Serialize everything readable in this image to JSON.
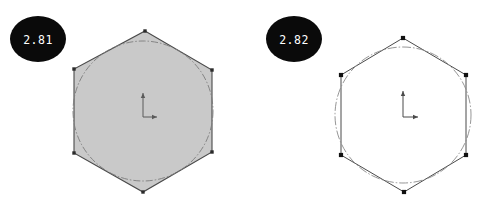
{
  "figure": {
    "background_color": "#ffffff",
    "width": 482,
    "height": 208,
    "panel_count": 2
  },
  "panels": [
    {
      "id": "panel-left",
      "badge": {
        "label": "2.81",
        "shape": "ellipse",
        "fill_color": "#0a0a0a",
        "text_color": "#ffffff",
        "cx": 38,
        "cy": 39,
        "rx": 28,
        "ry": 23
      },
      "polygon": {
        "name": "hexagon",
        "sides": 6,
        "filled": true,
        "fill_color": "#c9c9c9",
        "stroke_color": "#4a4a4a",
        "stroke_width": 1.1,
        "vertices": [
          [
            145,
            31
          ],
          [
            212,
            70
          ],
          [
            212,
            152
          ],
          [
            143,
            192
          ],
          [
            74,
            153
          ],
          [
            74,
            69
          ]
        ],
        "vertex_marker": {
          "shape": "square",
          "color": "#2b2b2b",
          "size": 3.4,
          "visible": true
        }
      },
      "inscribed_circle": {
        "cx": 143,
        "cy": 111,
        "r": 70,
        "stroke_color": "#7d7d7d",
        "stroke_width": 0.9,
        "dash_pattern": "7,2,1.5,2",
        "filled": false
      },
      "axis_marker": {
        "name": "orientation-axes",
        "origin": [
          143,
          117
        ],
        "vertical_arrow_length": 24,
        "horizontal_arrow_length": 14,
        "color": "#5a5a5a",
        "stroke_width": 1.0
      }
    },
    {
      "id": "panel-right",
      "badge": {
        "label": "2.82",
        "shape": "ellipse",
        "fill_color": "#0a0a0a",
        "text_color": "#ffffff",
        "cx": 294,
        "cy": 39,
        "rx": 28,
        "ry": 23
      },
      "polygon": {
        "name": "hexagon",
        "sides": 6,
        "filled": false,
        "fill_color": "none",
        "stroke_color": "#4a4a4a",
        "stroke_width": 1.0,
        "vertices": [
          [
            403,
            38
          ],
          [
            466,
            75
          ],
          [
            466,
            155
          ],
          [
            404,
            192
          ],
          [
            341,
            155
          ],
          [
            341,
            75
          ]
        ],
        "vertex_marker": {
          "shape": "square",
          "color": "#111111",
          "size": 4.2,
          "visible": true
        }
      },
      "inscribed_circle": {
        "cx": 403,
        "cy": 115,
        "r": 68,
        "stroke_color": "#8a8a8a",
        "stroke_width": 0.9,
        "dash_pattern": "9,2,1.5,2",
        "filled": false
      },
      "axis_marker": {
        "name": "orientation-axes",
        "origin": [
          403,
          117
        ],
        "vertical_arrow_length": 26,
        "horizontal_arrow_length": 15,
        "color": "#4a4a4a",
        "stroke_width": 1.0
      }
    }
  ]
}
